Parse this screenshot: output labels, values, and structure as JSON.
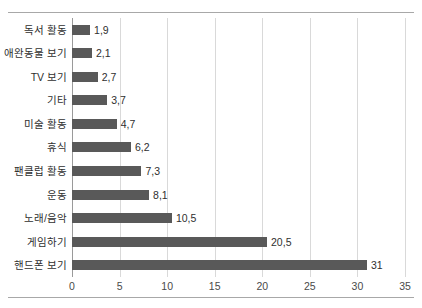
{
  "chart_data": {
    "type": "bar",
    "orientation": "horizontal",
    "title": "",
    "xlabel": "",
    "ylabel": "",
    "xlim": [
      0,
      35
    ],
    "xticks": [
      "0",
      "5",
      "10",
      "15",
      "20",
      "25",
      "30",
      "35"
    ],
    "xtick_values": [
      0,
      5,
      10,
      15,
      20,
      25,
      30,
      35
    ],
    "grid": true,
    "legend": "none",
    "bar_color": "#595959",
    "gridline_color": "#d9d9d9",
    "axis_color": "#9a9a9a",
    "decimal_separator": ",",
    "categories": [
      "독서 활동",
      "애완동물 보기",
      "TV 보기",
      "기타",
      "미술 활동",
      "휴식",
      "팬클럽 활동",
      "운동",
      "노래/음악",
      "게임하기",
      "핸드폰 보기"
    ],
    "values": [
      1.9,
      2.1,
      2.7,
      3.7,
      4.7,
      6.2,
      7.3,
      8.1,
      10.5,
      20.5,
      31
    ],
    "value_labels": [
      "1,9",
      "2,1",
      "2,7",
      "3,7",
      "4,7",
      "6,2",
      "7,3",
      "8,1",
      "10,5",
      "20,5",
      "31"
    ]
  }
}
